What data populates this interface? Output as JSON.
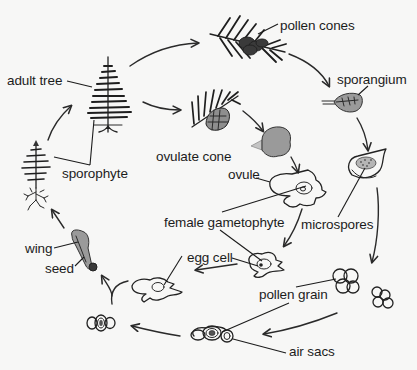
{
  "diagram": {
    "background": "#f7f7f6",
    "ink_color": "#222222",
    "fill_grey": "#9a9a9a",
    "labels": {
      "pollen_cones": "pollen cones",
      "sporangium": "sporangium",
      "adult_tree": "adult tree",
      "ovulate_cone": "ovulate cone",
      "ovule": "ovule",
      "sporophyte": "sporophyte",
      "female_gametophyte": "female gametophyte",
      "microspores": "microspores",
      "egg_cell": "egg cell",
      "wing": "wing",
      "seed": "seed",
      "pollen_grain": "pollen grain",
      "air_sacs": "air sacs"
    },
    "stages": [
      {
        "id": "adult-tree",
        "label_key": "adult_tree"
      },
      {
        "id": "pollen-cones",
        "label_key": "pollen_cones"
      },
      {
        "id": "sporangium",
        "label_key": "sporangium"
      },
      {
        "id": "microspores",
        "label_key": "microspores"
      },
      {
        "id": "pollen-grain",
        "label_key": "pollen_grain"
      },
      {
        "id": "ovulate-cone",
        "label_key": "ovulate_cone"
      },
      {
        "id": "ovule",
        "label_key": "ovule"
      },
      {
        "id": "female-gametophyte",
        "label_key": "female_gametophyte"
      },
      {
        "id": "egg-cell",
        "label_key": "egg_cell"
      },
      {
        "id": "seed",
        "label_key": "seed"
      },
      {
        "id": "sporophyte",
        "label_key": "sporophyte"
      }
    ]
  }
}
